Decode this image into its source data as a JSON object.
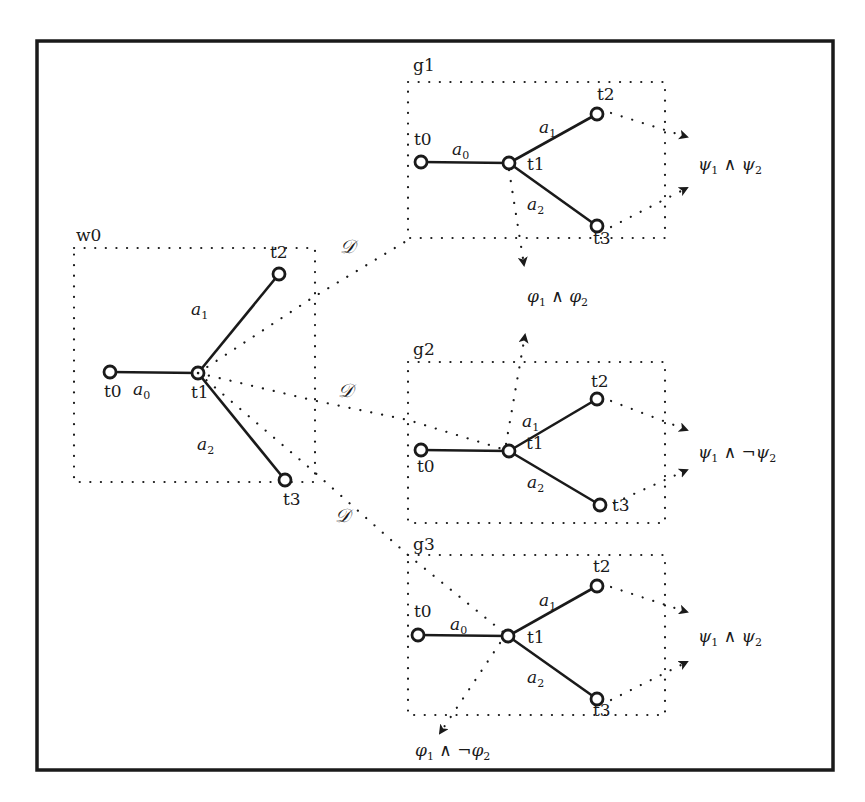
{
  "diagram": {
    "type": "world-to-goal-mapping",
    "frame": {
      "x": 37,
      "y": 41,
      "w": 796,
      "h": 729
    },
    "world": {
      "label": "w0",
      "box": {
        "x": 74,
        "y": 248,
        "w": 241,
        "h": 234
      },
      "nodes": {
        "t0": {
          "label": "t0",
          "x": 110,
          "y": 372
        },
        "t1": {
          "label": "t1",
          "x": 198,
          "y": 373
        },
        "t2": {
          "label": "t2",
          "x": 279,
          "y": 274
        },
        "t3": {
          "label": "t3",
          "x": 285,
          "y": 480
        }
      },
      "edges": [
        {
          "label": "a",
          "sub": "0",
          "from": "t0",
          "to": "t1"
        },
        {
          "label": "a",
          "sub": "1",
          "from": "t1",
          "to": "t2"
        },
        {
          "label": "a",
          "sub": "2",
          "from": "t1",
          "to": "t3"
        }
      ]
    },
    "goals": [
      {
        "label": "g1",
        "box": {
          "x": 408,
          "y": 82,
          "w": 257,
          "h": 156
        },
        "nodes": {
          "t0": {
            "label": "t0",
            "x": 421,
            "y": 162
          },
          "t1": {
            "label": "t1",
            "x": 509,
            "y": 163
          },
          "t2": {
            "label": "t2",
            "x": 597,
            "y": 114
          },
          "t3": {
            "label": "t3",
            "x": 597,
            "y": 226
          }
        },
        "edges": [
          {
            "label": "a",
            "sub": "0",
            "from": "t0",
            "to": "t1"
          },
          {
            "label": "a",
            "sub": "1",
            "from": "t1",
            "to": "t2"
          },
          {
            "label": "a",
            "sub": "2",
            "from": "t1",
            "to": "t3"
          }
        ],
        "outcome_right": {
          "text": "ψ₁ ∧ ψ₂",
          "parts": [
            "ψ",
            "1",
            " ∧ ",
            "ψ",
            "2"
          ]
        }
      },
      {
        "label": "g2",
        "box": {
          "x": 408,
          "y": 362,
          "w": 257,
          "h": 161
        },
        "nodes": {
          "t0": {
            "label": "t0",
            "x": 421,
            "y": 450
          },
          "t1": {
            "label": "t1",
            "x": 509,
            "y": 451
          },
          "t2": {
            "label": "t2",
            "x": 597,
            "y": 399
          },
          "t3": {
            "label": "t3",
            "x": 600,
            "y": 505
          }
        },
        "edges": [
          {
            "label": "a",
            "sub": "1",
            "from": "t1",
            "to": "t2"
          },
          {
            "label": "a",
            "sub": "2",
            "from": "t1",
            "to": "t3"
          }
        ],
        "outcome_right": {
          "text": "ψ₁ ∧ ¬ψ₂",
          "parts": [
            "ψ",
            "1",
            " ∧ ¬",
            "ψ",
            "2"
          ]
        }
      },
      {
        "label": "g3",
        "box": {
          "x": 408,
          "y": 555,
          "w": 257,
          "h": 160
        },
        "nodes": {
          "t0": {
            "label": "t0",
            "x": 418,
            "y": 635
          },
          "t1": {
            "label": "t1",
            "x": 508,
            "y": 636
          },
          "t2": {
            "label": "t2",
            "x": 597,
            "y": 586
          },
          "t3": {
            "label": "t3",
            "x": 597,
            "y": 699
          }
        },
        "edges": [
          {
            "label": "a",
            "sub": "0",
            "from": "t0",
            "to": "t1"
          },
          {
            "label": "a",
            "sub": "1",
            "from": "t1",
            "to": "t2"
          },
          {
            "label": "a",
            "sub": "2",
            "from": "t1",
            "to": "t3"
          }
        ],
        "outcome_right": {
          "text": "ψ₁ ∧ ψ₂",
          "parts": [
            "ψ",
            "1",
            " ∧ ",
            "ψ",
            "2"
          ]
        }
      }
    ],
    "mappings": [
      {
        "label": "𝒟",
        "to": "g1"
      },
      {
        "label": "𝒟",
        "to": "g2"
      },
      {
        "label": "𝒟",
        "to": "g3"
      }
    ],
    "phi_outcomes": [
      {
        "text": "φ₁ ∧ φ₂",
        "parts": [
          "φ",
          "1",
          " ∧ ",
          "φ",
          "2"
        ],
        "between": [
          "g1",
          "g2"
        ]
      },
      {
        "text": "φ₁ ∧ ¬φ₂",
        "parts": [
          "φ",
          "1",
          " ∧ ¬",
          "φ",
          "2"
        ],
        "from": "g3"
      }
    ]
  }
}
